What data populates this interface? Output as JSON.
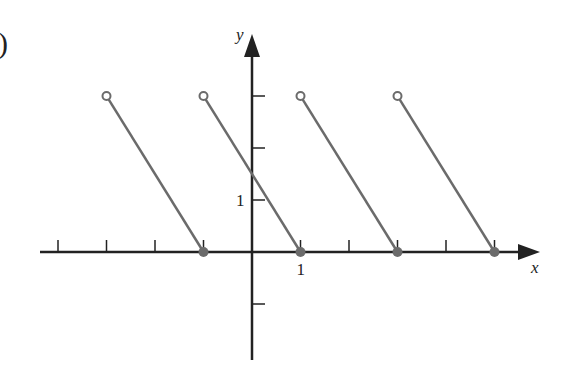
{
  "figure_label": ")",
  "chart_data": {
    "type": "line",
    "title": "",
    "xlabel": "x",
    "ylabel": "y",
    "x_tick_labels_shown": [
      "1"
    ],
    "y_tick_labels_shown": [
      "1"
    ],
    "x_ticks": [
      -4,
      -3,
      -2,
      -1,
      1,
      2,
      3,
      4,
      5
    ],
    "y_ticks": [
      -1,
      1,
      2,
      3
    ],
    "xlim": [
      -4.4,
      5.9
    ],
    "ylim": [
      -2.1,
      4.2
    ],
    "grid": false,
    "legend": null,
    "series": [
      {
        "name": "segment-1",
        "x": [
          -3,
          -1
        ],
        "y": [
          3,
          0
        ],
        "start": "open",
        "end": "closed"
      },
      {
        "name": "segment-2",
        "x": [
          -1,
          1
        ],
        "y": [
          3,
          0
        ],
        "start": "open",
        "end": "closed"
      },
      {
        "name": "segment-3",
        "x": [
          1,
          3
        ],
        "y": [
          3,
          0
        ],
        "start": "open",
        "end": "closed"
      },
      {
        "name": "segment-4",
        "x": [
          3,
          5
        ],
        "y": [
          3,
          0
        ],
        "start": "open",
        "end": "closed"
      }
    ],
    "colors": {
      "axis": "#222222",
      "curve": "#6b6b6b"
    }
  }
}
